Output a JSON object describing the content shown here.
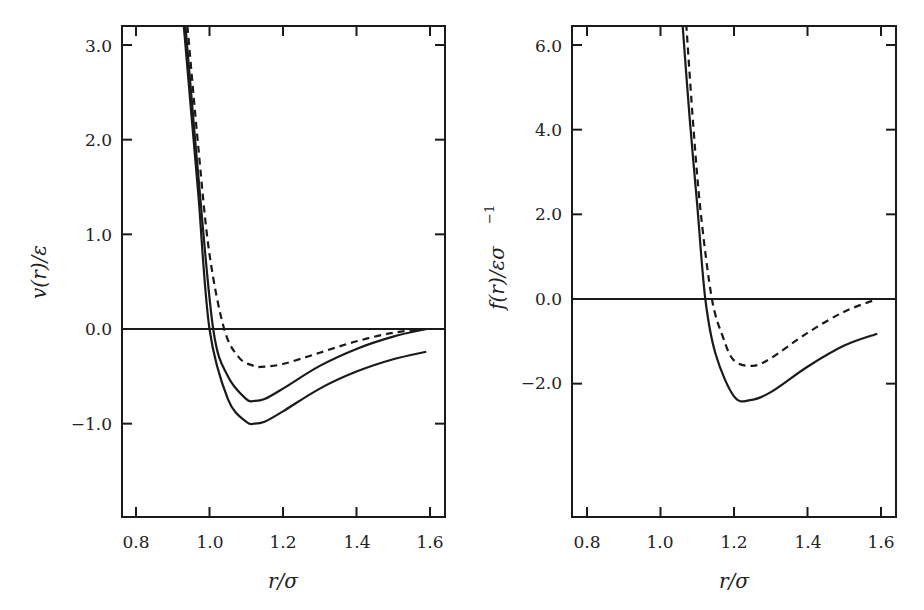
{
  "chart_data": [
    {
      "type": "line",
      "title": "",
      "xlabel": "r/σ",
      "ylabel": "v(r)/ε",
      "xlim": [
        0.76,
        1.64
      ],
      "ylim": [
        -1.2,
        3.2
      ],
      "xticks": [
        "0.8",
        "1.0",
        "1.2",
        "1.4",
        "1.6"
      ],
      "yticks": [
        "−1.0",
        "0.0",
        "1.0",
        "2.0",
        "3.0"
      ],
      "grid": false,
      "legend": null,
      "zero_line": true,
      "series": [
        {
          "name": "Lennard-Jones (full)",
          "style": "solid",
          "x": [
            0.93,
            0.95,
            0.97,
            1.0,
            1.05,
            1.1,
            1.122,
            1.15,
            1.2,
            1.3,
            1.4,
            1.5,
            1.59
          ],
          "y": [
            3.2,
            2.3,
            1.4,
            0.0,
            -0.74,
            -0.98,
            -1.0,
            -0.98,
            -0.87,
            -0.63,
            -0.45,
            -0.32,
            -0.24
          ]
        },
        {
          "name": "Truncated and shifted (rc = 1.6)",
          "style": "solid",
          "x": [
            0.93,
            0.95,
            0.97,
            1.01,
            1.05,
            1.1,
            1.122,
            1.15,
            1.2,
            1.3,
            1.4,
            1.5,
            1.59
          ],
          "y": [
            3.4,
            2.5,
            1.6,
            0.0,
            -0.5,
            -0.74,
            -0.76,
            -0.74,
            -0.63,
            -0.39,
            -0.21,
            -0.08,
            0.0
          ]
        },
        {
          "name": "Shifted-force (rc = 1.6)",
          "style": "dashed",
          "x": [
            0.94,
            0.97,
            1.0,
            1.04,
            1.08,
            1.12,
            1.14,
            1.2,
            1.3,
            1.4,
            1.5,
            1.59
          ],
          "y": [
            3.2,
            1.9,
            0.79,
            0.0,
            -0.3,
            -0.39,
            -0.4,
            -0.37,
            -0.25,
            -0.13,
            -0.04,
            0.0
          ]
        }
      ]
    },
    {
      "type": "line",
      "title": "",
      "xlabel": "r/σ",
      "ylabel": "f(r)/εσ⁻¹",
      "xlim": [
        0.76,
        1.64
      ],
      "ylim": [
        -3.5,
        6.5
      ],
      "xticks": [
        "0.8",
        "1.0",
        "1.2",
        "1.4",
        "1.6"
      ],
      "yticks": [
        "−2.0",
        "0.0",
        "2.0",
        "4.0",
        "6.0"
      ],
      "grid": false,
      "legend": null,
      "zero_line": true,
      "series": [
        {
          "name": "Lennard-Jones force (full / truncated)",
          "style": "solid",
          "x": [
            1.06,
            1.08,
            1.1,
            1.122,
            1.15,
            1.2,
            1.244,
            1.3,
            1.4,
            1.5,
            1.59
          ],
          "y": [
            6.5,
            4.2,
            2.2,
            0.0,
            -1.3,
            -2.3,
            -2.39,
            -2.2,
            -1.6,
            -1.1,
            -0.82
          ]
        },
        {
          "name": "Shifted-force",
          "style": "dashed",
          "x": [
            1.07,
            1.09,
            1.11,
            1.14,
            1.17,
            1.2,
            1.25,
            1.3,
            1.4,
            1.5,
            1.59
          ],
          "y": [
            6.5,
            4.0,
            2.0,
            0.0,
            -0.9,
            -1.45,
            -1.58,
            -1.4,
            -0.8,
            -0.3,
            0.0
          ]
        }
      ]
    }
  ],
  "panels": {
    "left": {
      "ylabel_main": "v(r)/ε",
      "xlabel": "r/σ",
      "xticks": [
        "0.8",
        "1.0",
        "1.2",
        "1.4",
        "1.6"
      ],
      "yticks": [
        "−1.0",
        "0.0",
        "1.0",
        "2.0",
        "3.0"
      ]
    },
    "right": {
      "ylabel_main": "f(r)/εσ",
      "ylabel_sup": "−1",
      "xlabel": "r/σ",
      "xticks": [
        "0.8",
        "1.0",
        "1.2",
        "1.4",
        "1.6"
      ],
      "yticks": [
        "−2.0",
        "0.0",
        "2.0",
        "4.0",
        "6.0"
      ]
    }
  },
  "colors": {
    "line": "#1a1a1a",
    "background": "#ffffff"
  }
}
